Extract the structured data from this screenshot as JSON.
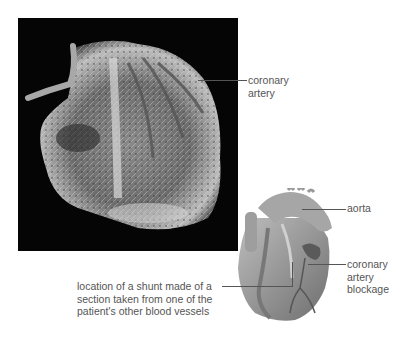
{
  "figure": {
    "photo": {
      "description": "resin cast of a human heart's coronary blood vessels on black background"
    },
    "illustration": {
      "description": "drawing of a human heart with a bypass shunt"
    },
    "labels": {
      "coronary_artery": "coronary\nartery",
      "aorta": "aorta",
      "blockage": "coronary\nartery\nblockage",
      "shunt": "location of a shunt made of a\nsection taken from one of the\npatient's other blood vessels"
    }
  }
}
